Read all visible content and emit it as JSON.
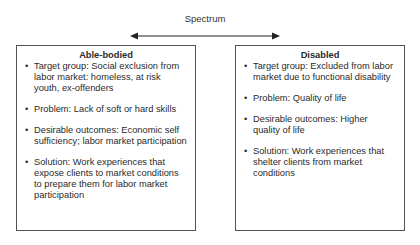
{
  "spectrum": {
    "label": "Spectrum"
  },
  "left_box": {
    "title": "Able-bodied",
    "items": [
      "Target group:  Social exclusion from labor market:  homeless, at risk youth, ex-offenders",
      "Problem: Lack of soft or hard skills",
      "Desirable outcomes: Economic self sufficiency; labor market participation",
      "Solution: Work experiences that expose clients to market conditions to prepare them for labor market participation"
    ]
  },
  "right_box": {
    "title": "Disabled",
    "items": [
      "Target group:  Excluded from labor market due to functional disability",
      "Problem: Quality of life",
      "Desirable outcomes: Higher quality of life",
      "Solution: Work experiences that shelter clients from market conditions"
    ]
  },
  "bullet_glyph": "•"
}
